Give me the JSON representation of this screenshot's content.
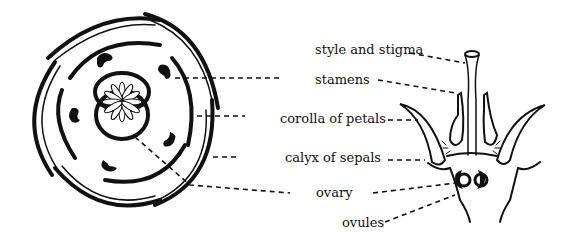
{
  "diagram": {
    "labels": [
      {
        "id": "style",
        "text": "style and stigma",
        "x": 315,
        "y": 54
      },
      {
        "id": "stamens",
        "text": "stamens",
        "x": 315,
        "y": 84
      },
      {
        "id": "corolla",
        "text": "corolla of petals",
        "x": 280,
        "y": 123
      },
      {
        "id": "calyx",
        "text": "calyx of sepals",
        "x": 285,
        "y": 162
      },
      {
        "id": "ovary",
        "text": "ovary",
        "x": 316,
        "y": 197
      },
      {
        "id": "ovules",
        "text": "ovules",
        "x": 342,
        "y": 227
      }
    ],
    "colors": {
      "ink": "#111111",
      "background": "#ffffff"
    }
  }
}
